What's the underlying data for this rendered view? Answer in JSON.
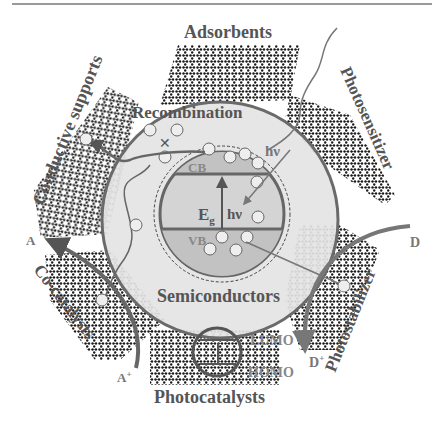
{
  "figure": {
    "title_rule": true,
    "colors": {
      "outer_fill": "#e4e4e4",
      "outer_stroke": "#6a6a6a",
      "inner_fill": "#cfcfcf",
      "band_fill": "#bdbdbd",
      "text": "#555555",
      "lattice": "#1a1a1a",
      "arrow": "#777777"
    },
    "labels": {
      "top": "Adsorbents",
      "top_left": "Conductive supports",
      "top_right": "Photosensitizer",
      "left": "Co-catalysts",
      "right": "Photostabilizer",
      "bottom": "Photocatalysts",
      "center_lower": "Semiconductors",
      "recombination": "Recombination",
      "hv_outer": "hν",
      "cb": "CB",
      "vb": "VB",
      "eg_main": "E",
      "eg_sub": "g",
      "hv_inner": "hν",
      "lumo": "LUMO",
      "homo": "HOMO",
      "a": "A",
      "a_plus": "A",
      "a_plus_sup": "+",
      "d": "D",
      "d_plus": "D",
      "d_plus_sup": "+"
    },
    "charges": {
      "electron": "−",
      "hole": "+"
    }
  }
}
